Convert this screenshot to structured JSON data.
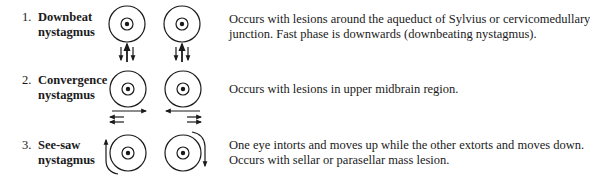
{
  "rows": [
    {
      "number": "1.",
      "title_line1": "Downbeat",
      "title_line2": "nystagmus",
      "desc_line1": "Occurs with lesions around the aqueduct of Sylvius or cervicomedullary",
      "desc_line2": "junction. Fast phase is downwards (downbeating nystagmus).",
      "icon": "eyes-vertical-arrows-icon"
    },
    {
      "number": "2.",
      "title_line1": "Convergence",
      "title_line2": "nystagmus",
      "desc_line1": "Occurs with lesions in upper midbrain region.",
      "icon": "eyes-horizontal-arrows-icon"
    },
    {
      "number": "3.",
      "title_line1": "See-saw",
      "title_line2": "nystagmus",
      "desc_line1": "One eye intorts and moves up while the other extorts and moves down.",
      "desc_line2": "Occurs with sellar or parasellar mass lesion.",
      "icon": "eyes-curved-arrows-icon"
    }
  ],
  "colors": {
    "ink": "#1a1a1a",
    "background": "#ffffff"
  }
}
